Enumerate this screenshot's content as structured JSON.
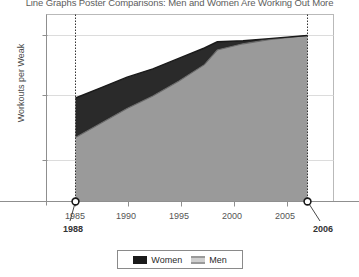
{
  "chart_data": {
    "type": "area",
    "title": "Line Graphs Poster Comparisons: Men and Women Are Working Out More",
    "xlabel": "",
    "ylabel": "Workouts per Weak",
    "xlim": [
      1983,
      2008
    ],
    "ylim": [
      0,
      10
    ],
    "xticks": [
      1985,
      1990,
      1995,
      2000,
      2005
    ],
    "xtick_labels": [
      "1985",
      "1990",
      "1995",
      "2000",
      "2005"
    ],
    "yticks": [
      3,
      6,
      9
    ],
    "ytick_labels": [
      "3",
      "6",
      "9"
    ],
    "grid": true,
    "legend_position": "bottom",
    "x": [
      1988,
      1990,
      1992,
      1994,
      1996,
      1998,
      1999,
      2001,
      2003,
      2006
    ],
    "series": [
      {
        "name": "Women",
        "color": "#1a1a1a",
        "values": [
          6.0,
          6.5,
          7.0,
          7.4,
          7.9,
          8.4,
          8.7,
          8.75,
          8.85,
          9.0
        ]
      },
      {
        "name": "Men",
        "color": "#9a9a9a",
        "values": [
          4.1,
          4.8,
          5.5,
          6.1,
          6.8,
          7.6,
          8.3,
          8.6,
          8.8,
          9.0
        ]
      }
    ],
    "annotations": [
      {
        "label": "1988",
        "x": 1988,
        "y": 0
      },
      {
        "label": "2006",
        "x": 2006,
        "y": 0
      }
    ]
  },
  "legend": {
    "items": [
      {
        "label": "Women",
        "color": "#1a1a1a"
      },
      {
        "label": "Men",
        "color": "#cfcfcf"
      }
    ]
  }
}
